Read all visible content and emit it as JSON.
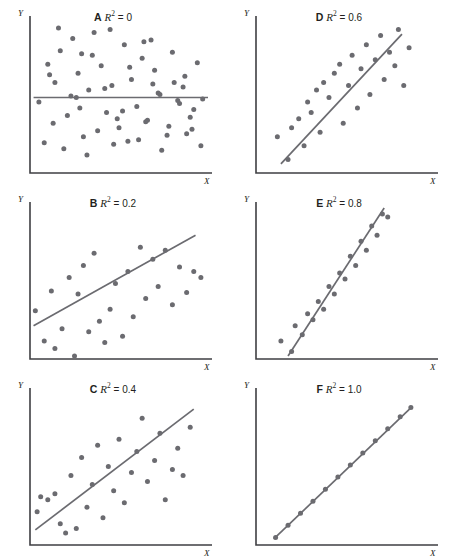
{
  "figure": {
    "background": "#ffffff",
    "ink_color": "#231f20",
    "mark_color": "#6b6b70",
    "axis_color": "#3f3f43",
    "cropped_header_text": "",
    "axis_labels": {
      "x": "X",
      "y": "Y"
    }
  },
  "chart_data": [
    {
      "type": "scatter",
      "panel": "A",
      "title": "A R2 = 0",
      "panel_letter": "A",
      "statistic_symbol": "R",
      "statistic_exponent": "2",
      "statistic_value": "0",
      "xlabel": "X",
      "ylabel": "Y",
      "grid": false,
      "legend": "none",
      "xlim": [
        0,
        100
      ],
      "ylim": [
        0,
        100
      ],
      "fit_line": {
        "x": [
          2,
          100
        ],
        "y": [
          50,
          50
        ],
        "slope": 0
      },
      "points_x": [
        5,
        10,
        14,
        17,
        21,
        24,
        27,
        30,
        33,
        36,
        40,
        43,
        46,
        50,
        53,
        57,
        60,
        63,
        66,
        70,
        73,
        77,
        80,
        84,
        87,
        90,
        94,
        97,
        8,
        13,
        19,
        23,
        28,
        32,
        38,
        42,
        47,
        52,
        56,
        61,
        65,
        69,
        74,
        78,
        83,
        88,
        92,
        96,
        16,
        26,
        35,
        45,
        55,
        64,
        72,
        81,
        91,
        11,
        29,
        49,
        68,
        86
      ],
      "points_y": [
        47,
        72,
        60,
        81,
        38,
        89,
        66,
        24,
        55,
        93,
        71,
        40,
        58,
        30,
        85,
        62,
        44,
        76,
        35,
        68,
        52,
        25,
        80,
        46,
        64,
        37,
        73,
        49,
        20,
        33,
        16,
        51,
        43,
        12,
        28,
        56,
        19,
        41,
        70,
        22,
        34,
        59,
        15,
        31,
        48,
        26,
        42,
        18,
        96,
        50,
        78,
        95,
        21,
        87,
        53,
        60,
        29,
        65,
        79,
        36,
        88,
        57
      ]
    },
    {
      "type": "scatter",
      "panel": "D",
      "title": "D R2 = 0.6",
      "panel_letter": "D",
      "statistic_symbol": "R",
      "statistic_exponent": "2",
      "statistic_value": "0.6",
      "xlabel": "X",
      "ylabel": "Y",
      "grid": false,
      "legend": "none",
      "xlim": [
        0,
        100
      ],
      "ylim": [
        0,
        100
      ],
      "fit_line": {
        "x": [
          14,
          82
        ],
        "y": [
          6,
          92
        ],
        "slope": 1.26
      },
      "points_x": [
        12,
        18,
        20,
        24,
        27,
        29,
        31,
        34,
        36,
        38,
        41,
        44,
        47,
        49,
        52,
        54,
        57,
        59,
        62,
        64,
        67,
        70,
        72,
        75,
        78,
        80,
        83,
        86
      ],
      "points_y": [
        24,
        9,
        30,
        36,
        18,
        47,
        40,
        55,
        27,
        60,
        50,
        66,
        72,
        33,
        58,
        78,
        43,
        69,
        85,
        52,
        75,
        91,
        62,
        80,
        71,
        95,
        58,
        83
      ]
    },
    {
      "type": "scatter",
      "panel": "B",
      "title": "B R2 = 0.2",
      "panel_letter": "B",
      "statistic_symbol": "R",
      "statistic_exponent": "2",
      "statistic_value": "0.2",
      "xlabel": "X",
      "ylabel": "Y",
      "grid": false,
      "legend": "none",
      "xlim": [
        0,
        100
      ],
      "ylim": [
        0,
        100
      ],
      "fit_line": {
        "x": [
          2,
          93
        ],
        "y": [
          22,
          82
        ],
        "slope": 0.66
      },
      "points_x": [
        3,
        8,
        12,
        14,
        18,
        22,
        25,
        27,
        30,
        33,
        36,
        39,
        42,
        45,
        48,
        52,
        55,
        58,
        62,
        65,
        69,
        72,
        76,
        80,
        84,
        88,
        92,
        96
      ],
      "points_y": [
        32,
        12,
        45,
        7,
        20,
        54,
        2,
        43,
        62,
        18,
        70,
        25,
        11,
        33,
        50,
        15,
        58,
        28,
        74,
        40,
        66,
        48,
        72,
        36,
        61,
        44,
        58,
        54
      ]
    },
    {
      "type": "scatter",
      "panel": "E",
      "title": "E R2 = 0.8",
      "panel_letter": "E",
      "statistic_symbol": "R",
      "statistic_exponent": "2",
      "statistic_value": "0.8",
      "xlabel": "X",
      "ylabel": "Y",
      "grid": false,
      "legend": "none",
      "xlim": [
        0,
        100
      ],
      "ylim": [
        0,
        100
      ],
      "fit_line": {
        "x": [
          18,
          72
        ],
        "y": [
          2,
          100
        ],
        "slope": 1.81
      },
      "points_x": [
        14,
        20,
        22,
        26,
        29,
        32,
        35,
        38,
        41,
        44,
        47,
        50,
        53,
        56,
        59,
        62,
        65,
        68,
        71,
        74
      ],
      "points_y": [
        12,
        5,
        22,
        16,
        30,
        26,
        38,
        33,
        48,
        43,
        57,
        53,
        68,
        62,
        78,
        72,
        88,
        82,
        96,
        94
      ]
    },
    {
      "type": "scatter",
      "panel": "C",
      "title": "C R2 = 0.4",
      "panel_letter": "C",
      "statistic_symbol": "R",
      "statistic_exponent": "2",
      "statistic_value": "0.4",
      "xlabel": "X",
      "ylabel": "Y",
      "grid": false,
      "legend": "none",
      "xlim": [
        0,
        100
      ],
      "ylim": [
        0,
        100
      ],
      "fit_line": {
        "x": [
          3,
          92
        ],
        "y": [
          10,
          90
        ],
        "slope": 0.9
      },
      "points_x": [
        4,
        6,
        10,
        14,
        17,
        20,
        23,
        26,
        29,
        32,
        35,
        38,
        41,
        44,
        47,
        50,
        53,
        57,
        60,
        63,
        66,
        70,
        73,
        76,
        80,
        83,
        86,
        90
      ],
      "points_y": [
        22,
        32,
        30,
        34,
        14,
        8,
        46,
        11,
        58,
        25,
        40,
        66,
        18,
        52,
        36,
        70,
        28,
        48,
        62,
        84,
        42,
        56,
        74,
        30,
        50,
        64,
        46,
        78
      ]
    },
    {
      "type": "scatter",
      "panel": "F",
      "title": "F R2 = 1.0",
      "panel_letter": "F",
      "statistic_symbol": "R",
      "statistic_exponent": "2",
      "statistic_value": "1.0",
      "xlabel": "X",
      "ylabel": "Y",
      "grid": false,
      "legend": "none",
      "xlim": [
        0,
        100
      ],
      "ylim": [
        0,
        100
      ],
      "fit_line": {
        "x": [
          10,
          88
        ],
        "y": [
          4,
          92
        ],
        "slope": 1.13
      },
      "points_x": [
        11,
        18,
        25,
        32,
        39,
        46,
        53,
        60,
        67,
        74,
        81,
        87
      ],
      "points_y": [
        5,
        13,
        21,
        29,
        37,
        45,
        53,
        61,
        69,
        77,
        85,
        91
      ]
    }
  ]
}
